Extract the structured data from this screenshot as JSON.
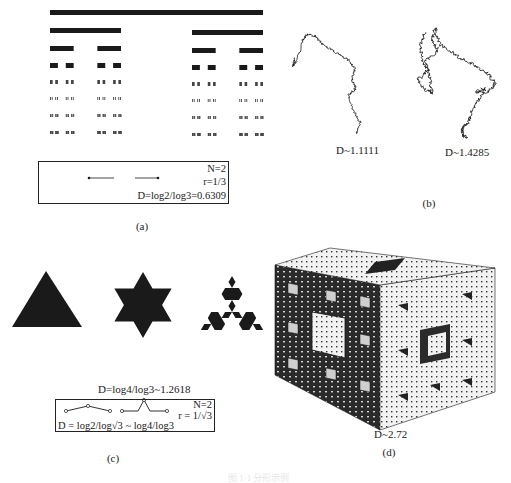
{
  "figure": {
    "panel_a": {
      "caption": "(a)",
      "box": {
        "n_label": "N=2",
        "r_label": "r=1/3",
        "d_label": "D=log2/log3=0.6309"
      },
      "cantor_levels": 8
    },
    "panel_b": {
      "caption": "(b)",
      "curves": [
        {
          "label": "D~1.1111"
        },
        {
          "label": "D~1.4285"
        }
      ]
    },
    "panel_c": {
      "caption": "(c)",
      "shapes": [
        "triangle",
        "hexagram",
        "koch-snowflake-iteration-2"
      ],
      "d_label": "D=log4/log3~1.2618",
      "box": {
        "n_label": "N=2",
        "r_label": "r = 1/√3",
        "d_label": "D = log2/log√3 ~ log4/log3"
      }
    },
    "panel_d": {
      "caption": "(d)",
      "d_label": "D~2.72"
    },
    "figure_caption": "图 1-1  分形示例"
  },
  "colors": {
    "ink": "#1a1a1a",
    "background": "#ffffff"
  }
}
